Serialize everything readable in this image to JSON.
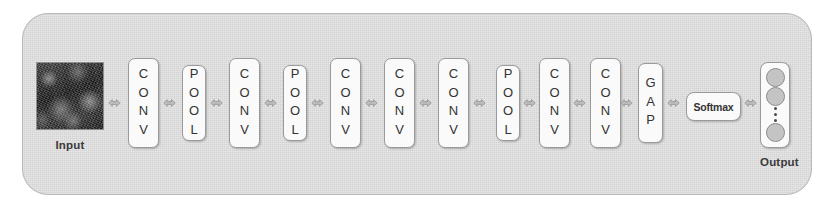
{
  "diagram": {
    "type": "cnn-pipeline",
    "background_color": "#ffffff",
    "container_color": "#d2d2d2",
    "block_color": "#fafafa",
    "block_border_color": "#9a9a9a",
    "text_color": "#333333"
  },
  "input": {
    "label": "Input",
    "description": "grayscale textured image patch"
  },
  "layers": [
    {
      "id": "conv-1",
      "label": "CONV",
      "kind": "conv",
      "x": 128
    },
    {
      "id": "pool-1",
      "label": "POOL",
      "kind": "pool",
      "x": 182
    },
    {
      "id": "conv-2",
      "label": "CONV",
      "kind": "conv",
      "x": 229
    },
    {
      "id": "pool-2",
      "label": "POOL",
      "kind": "pool",
      "x": 283
    },
    {
      "id": "conv-3",
      "label": "CONV",
      "kind": "conv",
      "x": 330
    },
    {
      "id": "conv-4",
      "label": "CONV",
      "kind": "conv",
      "x": 384
    },
    {
      "id": "conv-5",
      "label": "CONV",
      "kind": "conv",
      "x": 438
    },
    {
      "id": "pool-3",
      "label": "POOL",
      "kind": "pool",
      "x": 496
    },
    {
      "id": "conv-6",
      "label": "CONV",
      "kind": "conv",
      "x": 539
    },
    {
      "id": "conv-7",
      "label": "CONV",
      "kind": "conv",
      "x": 590
    },
    {
      "id": "gap-1",
      "label": "GAP",
      "kind": "gap",
      "x": 638
    }
  ],
  "softmax": {
    "label": "Softmax"
  },
  "output": {
    "label": "Output",
    "nodes": [
      {
        "id": "output-node-1",
        "type": "circle"
      },
      {
        "id": "output-node-2",
        "type": "circle"
      },
      {
        "id": "output-ellipsis",
        "type": "ellipsis",
        "dots": 3
      },
      {
        "id": "output-node-3",
        "type": "circle"
      }
    ]
  },
  "connectors": [
    {
      "id": "arrow-input-conv1",
      "x": 108
    },
    {
      "id": "arrow-conv1-pool1",
      "x": 163
    },
    {
      "id": "arrow-pool1-conv2",
      "x": 210
    },
    {
      "id": "arrow-conv2-pool2",
      "x": 264
    },
    {
      "id": "arrow-pool2-conv3",
      "x": 311
    },
    {
      "id": "arrow-conv3-conv4",
      "x": 365
    },
    {
      "id": "arrow-conv4-conv5",
      "x": 419
    },
    {
      "id": "arrow-conv5-pool3",
      "x": 473
    },
    {
      "id": "arrow-pool3-conv6",
      "x": 523
    },
    {
      "id": "arrow-conv6-conv7",
      "x": 573
    },
    {
      "id": "arrow-conv7-gap",
      "x": 620
    },
    {
      "id": "arrow-gap-softmax",
      "x": 667
    },
    {
      "id": "arrow-softmax-output",
      "x": 744
    }
  ]
}
